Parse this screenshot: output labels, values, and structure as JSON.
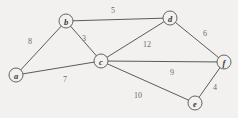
{
  "chart_data": {
    "type": "diagram",
    "diagram_kind": "weighted-undirected-graph",
    "title": "",
    "canvas": {
      "width": 238,
      "height": 118
    },
    "background_color": "#f2f1ef",
    "line_color": "#4a4a4a",
    "label_color": "#6b6b6b",
    "node_label_color": "#3a3a3a",
    "node_radius": 7,
    "nodes": [
      {
        "id": "a",
        "label": "a",
        "x": 16,
        "y": 75
      },
      {
        "id": "b",
        "label": "b",
        "x": 66,
        "y": 21
      },
      {
        "id": "c",
        "label": "c",
        "x": 101,
        "y": 61
      },
      {
        "id": "d",
        "label": "d",
        "x": 170,
        "y": 18
      },
      {
        "id": "e",
        "label": "e",
        "x": 195,
        "y": 103
      },
      {
        "id": "f",
        "label": "f",
        "x": 224,
        "y": 62
      }
    ],
    "edges": [
      {
        "id": "ab",
        "source": "a",
        "target": "b",
        "weight": "8",
        "label_x": 30,
        "label_y": 41
      },
      {
        "id": "ac",
        "source": "a",
        "target": "c",
        "weight": "7",
        "label_x": 65,
        "label_y": 79
      },
      {
        "id": "bc",
        "source": "b",
        "target": "c",
        "weight": "3",
        "label_x": 84,
        "label_y": 38
      },
      {
        "id": "bd",
        "source": "b",
        "target": "d",
        "weight": "5",
        "label_x": 113,
        "label_y": 10
      },
      {
        "id": "cd",
        "source": "c",
        "target": "d",
        "weight": "12",
        "label_x": 147,
        "label_y": 44
      },
      {
        "id": "cf",
        "source": "c",
        "target": "f",
        "weight": "9",
        "label_x": 172,
        "label_y": 72
      },
      {
        "id": "ce",
        "source": "c",
        "target": "e",
        "weight": "10",
        "label_x": 138,
        "label_y": 95
      },
      {
        "id": "df",
        "source": "d",
        "target": "f",
        "weight": "6",
        "label_x": 205,
        "label_y": 33
      },
      {
        "id": "ef",
        "source": "e",
        "target": "f",
        "weight": "4",
        "label_x": 215,
        "label_y": 87
      }
    ]
  }
}
